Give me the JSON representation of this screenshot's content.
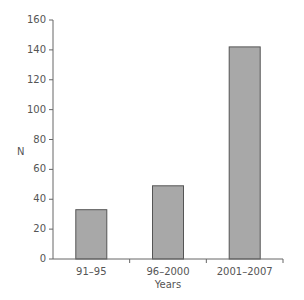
{
  "chart_data": {
    "type": "bar",
    "title": "",
    "xlabel": "Years",
    "ylabel": "N",
    "categories": [
      "91–95",
      "96–2000",
      "2001–2007"
    ],
    "values": [
      33,
      49,
      142
    ],
    "ylim": [
      0,
      160
    ],
    "yticks": [
      0,
      20,
      40,
      60,
      80,
      100,
      120,
      140,
      160
    ],
    "grid": false,
    "legend": null,
    "bar_color": "#a8a8a8",
    "bar_edge_color": "#555555",
    "axis_color": "#666666"
  }
}
